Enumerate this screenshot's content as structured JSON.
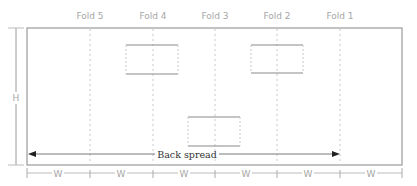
{
  "diagram": {
    "title": "",
    "folds": [
      {
        "label": "Fold 5",
        "x": 90
      },
      {
        "label": "Fold 4",
        "x": 153
      },
      {
        "label": "Fold 3",
        "x": 215
      },
      {
        "label": "Fold 2",
        "x": 277
      },
      {
        "label": "Fold 1",
        "x": 340
      }
    ],
    "height_label": "H",
    "width_label": "W",
    "width_segments": 6,
    "back_spread_label": "Back spread",
    "panels": [
      {
        "name": "panel-top-left",
        "x": 126,
        "y": 45,
        "w": 52,
        "h": 29
      },
      {
        "name": "panel-top-right",
        "x": 251,
        "y": 45,
        "w": 52,
        "h": 28
      },
      {
        "name": "panel-bottom-center",
        "x": 188,
        "y": 117,
        "w": 52,
        "h": 29
      }
    ],
    "colors": {
      "outline": "#9a9a9a",
      "fold_line": "#c8c8c8",
      "label": "#a6a6a6",
      "arrow": "#222222",
      "text_dark": "#333333"
    }
  }
}
